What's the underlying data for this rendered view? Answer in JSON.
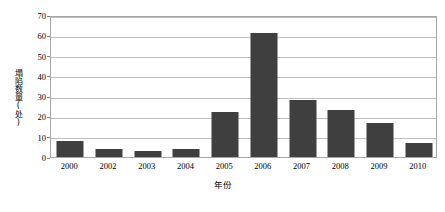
{
  "chart_data": {
    "type": "bar",
    "title": "",
    "xlabel": "年份",
    "ylabel": "塌陷数量(处)",
    "categories": [
      "2000",
      "2002",
      "2003",
      "2004",
      "2005",
      "2006",
      "2007",
      "2008",
      "2009",
      "2010"
    ],
    "values": [
      8,
      4,
      3,
      4,
      22,
      61,
      28,
      23,
      17,
      7
    ],
    "ylim": [
      0,
      70
    ],
    "ytick_step": 10,
    "yticks": [
      0,
      10,
      20,
      30,
      40,
      50,
      60,
      70
    ],
    "grid": true,
    "legend": "none",
    "series": [
      {
        "name": "塌陷数量",
        "values": [
          8,
          4,
          3,
          4,
          22,
          61,
          28,
          23,
          17,
          7
        ]
      }
    ],
    "colors": {
      "bar": "#3f3f3f",
      "gridline": "#bfbfbf",
      "frame": "#a6a6a6",
      "text": "#000000",
      "background": "#ffffff"
    }
  }
}
